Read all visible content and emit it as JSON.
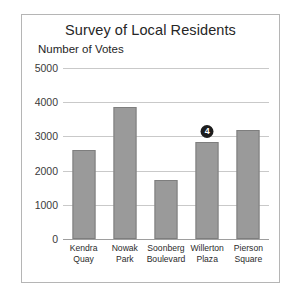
{
  "chart_data": {
    "type": "bar",
    "title": "Survey of Local Residents",
    "xlabel": "",
    "ylabel": "Number of Votes",
    "ylim": [
      0,
      5000
    ],
    "yticks": [
      0,
      1000,
      2000,
      3000,
      4000,
      5000
    ],
    "ytick_labels": [
      "0",
      "1000",
      "2000",
      "3000",
      "4000",
      "5000"
    ],
    "grid": true,
    "legend": false,
    "categories": [
      "Kendra Quay",
      "Nowak Park",
      "Soonberg Boulevard",
      "Willerton Plaza",
      "Pierson Square"
    ],
    "category_lines": [
      [
        "Kendra",
        "Quay"
      ],
      [
        "Nowak",
        "Park"
      ],
      [
        "Soonberg",
        "Boulevard"
      ],
      [
        "Willerton",
        "Plaza"
      ],
      [
        "Pierson",
        "Square"
      ]
    ],
    "values": [
      2600,
      3850,
      1730,
      2830,
      3180
    ],
    "annotations": [
      {
        "category": "Willerton Plaza",
        "label": "4",
        "kind": "circled-number-badge"
      }
    ]
  },
  "colors": {
    "bar_fill": "#9a9a9a",
    "bar_stroke": "#7e7e7e",
    "gridline": "#c9c9c9",
    "axis": "#9e9e9e",
    "frame": "#b5b5b5",
    "text": "#262626",
    "badge_bg": "#1d1d1d",
    "badge_text": "#ffffff",
    "background": "#ffffff"
  }
}
